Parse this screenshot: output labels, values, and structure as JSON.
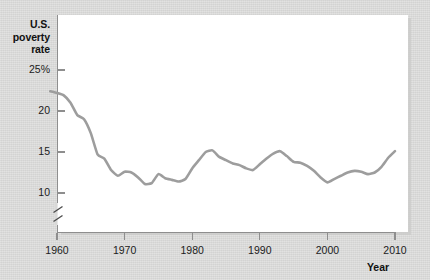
{
  "chart_data": {
    "type": "line",
    "title": "",
    "subtitle": "",
    "xlabel": "Year",
    "ylabel": "U.S. poverty rate",
    "ylabel_lines": [
      "U.S.",
      "poverty",
      "rate"
    ],
    "grid": false,
    "legend": false,
    "legend_position": "none",
    "y_axis_break": true,
    "y_axis_break_note": "axis broken below 10, does not start at zero",
    "xlim": [
      1959,
      2010
    ],
    "ylim": [
      9.0,
      26.6
    ],
    "xticks": [
      1960,
      1970,
      1980,
      1990,
      2000,
      2010
    ],
    "xtick_labels": [
      "1960",
      "1970",
      "1980",
      "1990",
      "2000",
      "2010"
    ],
    "yticks": [
      10,
      15,
      20,
      25
    ],
    "ytick_labels": [
      "10",
      "15",
      "20",
      "25%"
    ],
    "line_color": "#9d9d9d",
    "line_width": 2.6,
    "series": [
      {
        "name": "U.S. poverty rate",
        "units": "percent",
        "x": [
          1959,
          1960,
          1961,
          1962,
          1963,
          1964,
          1965,
          1966,
          1967,
          1968,
          1969,
          1970,
          1971,
          1972,
          1973,
          1974,
          1975,
          1976,
          1977,
          1978,
          1979,
          1980,
          1981,
          1982,
          1983,
          1984,
          1985,
          1986,
          1987,
          1988,
          1989,
          1990,
          1991,
          1992,
          1993,
          1994,
          1995,
          1996,
          1997,
          1998,
          1999,
          2000,
          2001,
          2002,
          2003,
          2004,
          2005,
          2006,
          2007,
          2008,
          2009,
          2010
        ],
        "values": [
          22.4,
          22.2,
          21.9,
          21.0,
          19.5,
          19.0,
          17.3,
          14.7,
          14.2,
          12.8,
          12.1,
          12.6,
          12.5,
          11.9,
          11.1,
          11.2,
          12.3,
          11.8,
          11.6,
          11.4,
          11.7,
          13.0,
          14.0,
          15.0,
          15.2,
          14.4,
          14.0,
          13.6,
          13.4,
          13.0,
          12.8,
          13.5,
          14.2,
          14.8,
          15.1,
          14.5,
          13.8,
          13.7,
          13.3,
          12.7,
          11.9,
          11.3,
          11.7,
          12.1,
          12.5,
          12.7,
          12.6,
          12.3,
          12.5,
          13.2,
          14.3,
          15.1
        ]
      }
    ]
  },
  "axes": {
    "y_title_lines": [
      "U.S.",
      "poverty",
      "rate"
    ],
    "x_title": "Year",
    "y_ticks": [
      {
        "label": "25%",
        "value": 25
      },
      {
        "label": "20",
        "value": 20
      },
      {
        "label": "15",
        "value": 15
      },
      {
        "label": "10",
        "value": 10
      }
    ],
    "x_ticks": [
      {
        "label": "1960",
        "value": 1960
      },
      {
        "label": "1970",
        "value": 1970
      },
      {
        "label": "1980",
        "value": 1980
      },
      {
        "label": "1990",
        "value": 1990
      },
      {
        "label": "2000",
        "value": 2000
      },
      {
        "label": "2010",
        "value": 2010
      }
    ]
  },
  "colors": {
    "background": "#d8d8d7",
    "plot_background": "#ffffff",
    "axis": "#8e8e8e",
    "line": "#9d9d9d",
    "text": "#111111"
  }
}
